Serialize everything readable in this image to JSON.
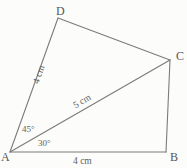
{
  "figure": {
    "background_color": "#fcfcfb",
    "stroke_color": "#7b7b7b",
    "text_color": "#5e5e5e",
    "cropped_header_text": "",
    "vertices": [
      {
        "name": "A",
        "label": "A",
        "x": 10,
        "y": 152
      },
      {
        "name": "B",
        "label": "B",
        "x": 166,
        "y": 152
      },
      {
        "name": "C",
        "label": "C",
        "x": 170,
        "y": 60
      },
      {
        "name": "D",
        "label": "D",
        "x": 58,
        "y": 18
      }
    ],
    "edges": [
      {
        "name": "side-AD",
        "from": "A",
        "to": "D"
      },
      {
        "name": "side-DC",
        "from": "D",
        "to": "C"
      },
      {
        "name": "side-CB",
        "from": "C",
        "to": "B"
      },
      {
        "name": "side-AB",
        "from": "A",
        "to": "B"
      },
      {
        "name": "diagonal-AC",
        "from": "A",
        "to": "C"
      }
    ],
    "length_labels": [
      {
        "name": "length-AD",
        "text": "4 cm",
        "segment": "AD"
      },
      {
        "name": "length-AC",
        "text": "5 cm",
        "segment": "AC"
      },
      {
        "name": "length-AB",
        "text": "4 cm",
        "segment": "AB"
      }
    ],
    "angle_labels": [
      {
        "name": "angle-DAC",
        "text": "45°",
        "vertex": "A",
        "between": "AD and AC"
      },
      {
        "name": "angle-CAB",
        "text": "30°",
        "vertex": "A",
        "between": "AC and AB"
      }
    ]
  }
}
